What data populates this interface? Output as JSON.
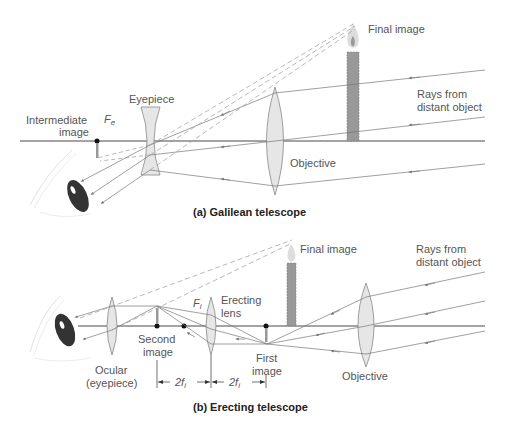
{
  "panel_a": {
    "caption": "(a)  Galilean telescope",
    "labels": {
      "final_image": "Final image",
      "rays_from": "Rays from",
      "distant_object": "distant object",
      "eyepiece": "Eyepiece",
      "intermediate": "Intermediate",
      "image": "image",
      "focal_point": "F",
      "focal_sub": "e",
      "objective": "Objective"
    }
  },
  "panel_b": {
    "caption": "(b)  Erecting telescope",
    "labels": {
      "final_image": "Final image",
      "rays_from": "Rays from",
      "distant_object": "distant object",
      "erecting": "Erecting",
      "lens": "lens",
      "focal_point": "F",
      "focal_sub": "i",
      "second": "Second",
      "second_image": "image",
      "first": "First",
      "first_image": "image",
      "ocular": "Ocular",
      "eyepiece_paren": "(eyepiece)",
      "objective": "Objective",
      "dim_left": "2f",
      "dim_left_sub": "i",
      "dim_right": "2f",
      "dim_right_sub": "i"
    }
  },
  "colors": {
    "axis": "#333333",
    "ray": "#777777",
    "lens_fill": "#e6e6e6",
    "lens_stroke": "#888888",
    "candle": "#999999",
    "flame": "#cccccc",
    "eye": "#222222",
    "label": "#555555"
  }
}
